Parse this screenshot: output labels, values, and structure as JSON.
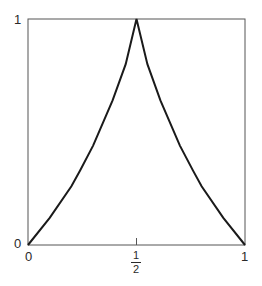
{
  "chart_data": {
    "type": "line",
    "title": "",
    "xlabel": "",
    "ylabel": "",
    "xlim": [
      0,
      1
    ],
    "ylim": [
      0,
      1
    ],
    "grid": false,
    "legend": null,
    "x_ticks": [
      {
        "value": 0,
        "label": "0"
      },
      {
        "value": 0.5,
        "label": "1/2",
        "numerator": "1",
        "denominator": "2"
      },
      {
        "value": 1,
        "label": "1"
      }
    ],
    "y_ticks": [
      {
        "value": 0,
        "label": "0"
      },
      {
        "value": 1,
        "label": "1"
      }
    ],
    "series": [
      {
        "name": "curve",
        "color": "#1a1a1a",
        "x": [
          0,
          0.1,
          0.2,
          0.24,
          0.3,
          0.39,
          0.45,
          0.5,
          0.55,
          0.61,
          0.7,
          0.76,
          0.8,
          0.9,
          1
        ],
        "y": [
          0,
          0.12,
          0.26,
          0.33,
          0.44,
          0.64,
          0.8,
          1,
          0.8,
          0.64,
          0.44,
          0.33,
          0.26,
          0.12,
          0
        ]
      }
    ]
  },
  "labels": {
    "y_top": "1",
    "y_bottom": "0",
    "x_left": "0",
    "x_right": "1",
    "x_mid_num": "1",
    "x_mid_den": "2"
  }
}
